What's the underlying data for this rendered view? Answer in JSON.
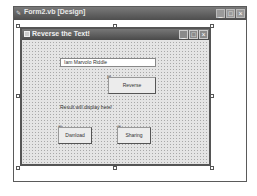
{
  "outer_window": {
    "title": "Form2.vb [Design]",
    "controls": {
      "minimize": "_",
      "maximize": "□",
      "close": "×"
    }
  },
  "form": {
    "title": "Reverse the Text!",
    "controls": {
      "minimize": "_",
      "maximize": "□",
      "close": "×"
    },
    "textbox": {
      "value": "Iam Marvolo Riddle"
    },
    "reverse_button": {
      "label": "Reverse"
    },
    "result_label": {
      "text": "Result will display here!"
    },
    "download_button": {
      "label": "Dwnload"
    },
    "sharing_button": {
      "label": "Sharing"
    }
  },
  "colors": {
    "title_bar": "#5a5a5a",
    "form_bg": "#e4e4e4",
    "design_bg": "#ffffff"
  }
}
